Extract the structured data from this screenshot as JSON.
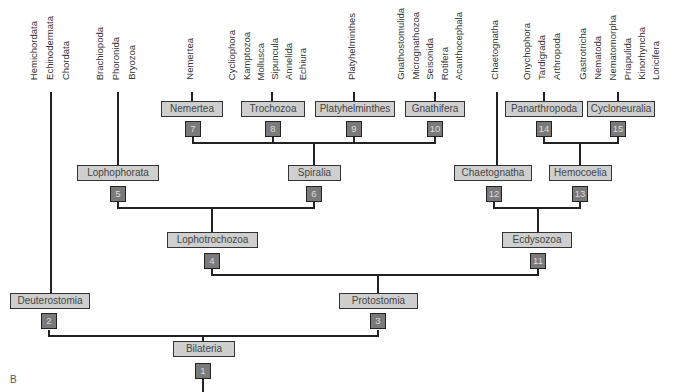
{
  "panel_label": "B",
  "taxa": [
    {
      "label": "Hemichordata",
      "x": 34
    },
    {
      "label": "Echinodermata",
      "x": 50
    },
    {
      "label": "Chordata",
      "x": 66
    },
    {
      "label": "Brachiopoda",
      "x": 100
    },
    {
      "label": "Phoronida",
      "x": 116
    },
    {
      "label": "Bryozoa",
      "x": 132
    },
    {
      "label": "Nemertea",
      "x": 190
    },
    {
      "label": "Cycliophora",
      "x": 232
    },
    {
      "label": "Kamptozoa",
      "x": 247
    },
    {
      "label": "Mollusca",
      "x": 261
    },
    {
      "label": "Sipuncula",
      "x": 275
    },
    {
      "label": "Annelida",
      "x": 289
    },
    {
      "label": "Echiura",
      "x": 303
    },
    {
      "label": "Platyhelminthes",
      "x": 352
    },
    {
      "label": "Gnathostomulida",
      "x": 401
    },
    {
      "label": "Micrognathozoa",
      "x": 416
    },
    {
      "label": "Seisonida",
      "x": 430
    },
    {
      "label": "Rotifera",
      "x": 445
    },
    {
      "label": "Acanthocephala",
      "x": 459
    },
    {
      "label": "Chaetognatha",
      "x": 495
    },
    {
      "label": "Onychophora",
      "x": 527
    },
    {
      "label": "Tardigrada",
      "x": 542
    },
    {
      "label": "Arthropoda",
      "x": 557
    },
    {
      "label": "Gastrotricha",
      "x": 583
    },
    {
      "label": "Nematoda",
      "x": 598
    },
    {
      "label": "Nematomorpha",
      "x": 613
    },
    {
      "label": "Priapulida",
      "x": 628
    },
    {
      "label": "Kinorhyncha",
      "x": 642
    },
    {
      "label": "Loricifera",
      "x": 656
    }
  ],
  "clades": [
    {
      "label": "Bilateria",
      "node": "1",
      "x": 173,
      "y": 341,
      "w": 62,
      "nx": 195,
      "ny": 363
    },
    {
      "label": "Deuterostomia",
      "node": "2",
      "x": 10,
      "y": 293,
      "w": 80,
      "nx": 41,
      "ny": 313
    },
    {
      "label": "Protostomia",
      "node": "3",
      "x": 339,
      "y": 293,
      "w": 79,
      "nx": 370,
      "ny": 313
    },
    {
      "label": "Lophotrochozoa",
      "node": "4",
      "x": 167,
      "y": 232,
      "w": 91,
      "nx": 204,
      "ny": 253
    },
    {
      "label": "Lophophorata",
      "node": "5",
      "x": 77,
      "y": 165,
      "w": 82,
      "nx": 110,
      "ny": 186
    },
    {
      "label": "Spiralia",
      "node": "6",
      "x": 288,
      "y": 165,
      "w": 53,
      "nx": 306,
      "ny": 186
    },
    {
      "label": "Nemertea",
      "node": "7",
      "x": 161,
      "y": 101,
      "w": 62,
      "nx": 185,
      "ny": 121
    },
    {
      "label": "Trochozoa",
      "node": "8",
      "x": 241,
      "y": 101,
      "w": 64,
      "nx": 265,
      "ny": 121
    },
    {
      "label": "Platyhelminthes",
      "node": "9",
      "x": 315,
      "y": 101,
      "w": 80,
      "nx": 346,
      "ny": 121
    },
    {
      "label": "Gnathifera",
      "node": "10",
      "x": 405,
      "y": 101,
      "w": 60,
      "nx": 427,
      "ny": 121
    },
    {
      "label": "Ecdysozoa",
      "node": "11",
      "x": 502,
      "y": 232,
      "w": 70,
      "nx": 530,
      "ny": 253
    },
    {
      "label": "Chaetognatha",
      "node": "12",
      "x": 454,
      "y": 165,
      "w": 78,
      "nx": 486,
      "ny": 186
    },
    {
      "label": "Hemocoelia",
      "node": "13",
      "x": 549,
      "y": 165,
      "w": 63,
      "nx": 572,
      "ny": 186
    },
    {
      "label": "Panarthropoda",
      "node": "14",
      "x": 505,
      "y": 101,
      "w": 78,
      "nx": 536,
      "ny": 121
    },
    {
      "label": "Cycloneuralia",
      "node": "15",
      "x": 587,
      "y": 101,
      "w": 68,
      "nx": 610,
      "ny": 121
    }
  ],
  "edges": [
    {
      "d": "M51 92 V293"
    },
    {
      "d": "M118 92 V165"
    },
    {
      "d": "M192 92 V101"
    },
    {
      "d": "M272 92 V101"
    },
    {
      "d": "M354 92 V101"
    },
    {
      "d": "M435 92 V101"
    },
    {
      "d": "M497 92 V165"
    },
    {
      "d": "M544 92 V101"
    },
    {
      "d": "M618 92 V101"
    },
    {
      "d": "M193 137 V143 H435 V137"
    },
    {
      "d": "M273 137 V143"
    },
    {
      "d": "M354 137 V143"
    },
    {
      "d": "M314 143 V165"
    },
    {
      "d": "M544 137 V143 H618 V137"
    },
    {
      "d": "M580 143 V165"
    },
    {
      "d": "M118 202 V208 H314 V202"
    },
    {
      "d": "M212 208 V232"
    },
    {
      "d": "M494 202 V208 H580 V202"
    },
    {
      "d": "M538 208 V232"
    },
    {
      "d": "M212 269 V275 H538 V269"
    },
    {
      "d": "M378 275 V293"
    },
    {
      "d": "M49 330 V336 H378 V330"
    },
    {
      "d": "M203 336 V341"
    },
    {
      "d": "M203 379 V392"
    }
  ]
}
